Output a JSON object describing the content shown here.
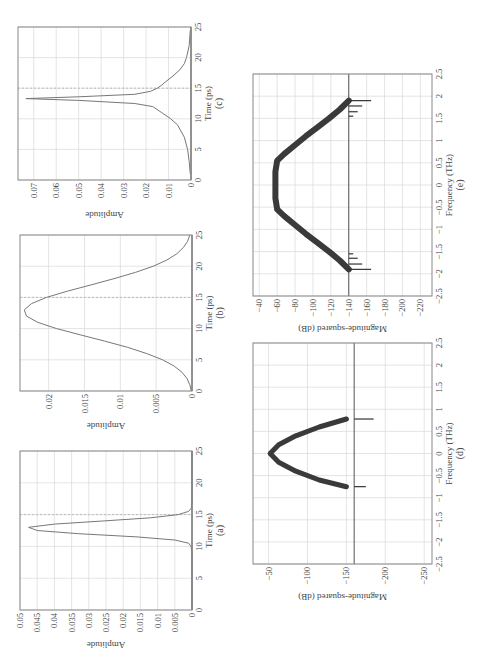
{
  "figure": {
    "panels": [
      "(a)",
      "(b)",
      "(c)",
      "(d)",
      "(e)"
    ]
  },
  "chart_data": [
    {
      "id": "a",
      "type": "line",
      "panel_label": "(a)",
      "xlabel": "Time (ps)",
      "ylabel": "Amplitude",
      "xlim": [
        0,
        25
      ],
      "ylim": [
        0,
        0.05
      ],
      "xticks": [
        0,
        5,
        10,
        15,
        20,
        25
      ],
      "yticks": [
        0,
        0.005,
        0.01,
        0.015,
        0.02,
        0.025,
        0.03,
        0.035,
        0.04,
        0.045,
        0.05
      ],
      "ytick_labels": [
        "0",
        "0.005",
        "0.01",
        "0.015",
        "0.02",
        "0.025",
        "0.03",
        "0.035",
        "0.04",
        "0.045",
        "0.05"
      ],
      "grid": true,
      "dashed_marker_x": 15,
      "series": [
        {
          "name": "pulse",
          "x": [
            0,
            9,
            10,
            10.5,
            11,
            11.5,
            12,
            12.5,
            13,
            13.5,
            14,
            14.5,
            15,
            15.5,
            16,
            17,
            25
          ],
          "values": [
            0,
            0,
            0.0003,
            0.001,
            0.005,
            0.016,
            0.033,
            0.045,
            0.0475,
            0.04,
            0.026,
            0.012,
            0.004,
            0.001,
            0.0002,
            0,
            0
          ]
        }
      ]
    },
    {
      "id": "b",
      "type": "line",
      "panel_label": "(b)",
      "xlabel": "Time (ps)",
      "ylabel": "Amplitude",
      "xlim": [
        0,
        25
      ],
      "ylim": [
        0,
        0.024
      ],
      "xticks": [
        0,
        5,
        10,
        15,
        20,
        25
      ],
      "yticks": [
        0,
        0.005,
        0.01,
        0.015,
        0.02
      ],
      "ytick_labels": [
        "0",
        "0.005",
        "0.01",
        "0.015",
        "0.02"
      ],
      "grid": true,
      "dashed_marker_x": 15,
      "series": [
        {
          "name": "pulse",
          "x": [
            0,
            1,
            2,
            3,
            4,
            5,
            6,
            7,
            8,
            9,
            10,
            11,
            12,
            13,
            14,
            15,
            16,
            17,
            18,
            19,
            20,
            21,
            22,
            23,
            24,
            25
          ],
          "values": [
            0.0001,
            0.0003,
            0.0007,
            0.0014,
            0.0025,
            0.0041,
            0.0063,
            0.009,
            0.0122,
            0.0156,
            0.0189,
            0.0215,
            0.0231,
            0.0234,
            0.0224,
            0.0203,
            0.0174,
            0.0141,
            0.0109,
            0.0079,
            0.0054,
            0.0035,
            0.0021,
            0.0012,
            0.0006,
            0.0003
          ]
        }
      ]
    },
    {
      "id": "c",
      "type": "line",
      "panel_label": "(c)",
      "xlabel": "Time (ps)",
      "ylabel": "Amplitude",
      "xlim": [
        0,
        25
      ],
      "ylim": [
        0,
        0.077
      ],
      "xticks": [
        0,
        5,
        10,
        15,
        20,
        25
      ],
      "yticks": [
        0,
        0.01,
        0.02,
        0.03,
        0.04,
        0.05,
        0.06,
        0.07
      ],
      "ytick_labels": [
        "0",
        "0.01",
        "0.02",
        "0.03",
        "0.04",
        "0.05",
        "0.06",
        "0.07"
      ],
      "grid": true,
      "dashed_marker_x": 15,
      "series": [
        {
          "name": "pulse",
          "x": [
            1,
            3,
            5,
            7,
            9,
            10,
            11,
            12,
            12.5,
            13,
            13.3,
            13.6,
            14,
            14.5,
            15,
            15.5,
            16,
            17,
            18,
            19,
            20,
            22,
            24.5
          ],
          "values": [
            0.0003,
            0.0008,
            0.0015,
            0.003,
            0.006,
            0.009,
            0.013,
            0.017,
            0.025,
            0.05,
            0.0735,
            0.05,
            0.025,
            0.018,
            0.015,
            0.013,
            0.0115,
            0.008,
            0.005,
            0.003,
            0.002,
            0.0008,
            0.0003
          ]
        }
      ]
    },
    {
      "id": "d",
      "type": "line",
      "panel_label": "(d)",
      "xlabel": "Frequency (THz)",
      "ylabel": "Magnitude-squared (dB)",
      "xlim": [
        -2.5,
        2.5
      ],
      "ylim": [
        -260,
        -30
      ],
      "xticks": [
        -2.5,
        -2,
        -1.5,
        -1,
        -0.5,
        0,
        0.5,
        1,
        1.5,
        2,
        2.5
      ],
      "yticks": [
        -250,
        -200,
        -150,
        -100,
        -50
      ],
      "ytick_labels": [
        "−250",
        "−200",
        "−150",
        "−100",
        "−50"
      ],
      "grid": true,
      "noise_floor_db": -160,
      "series": [
        {
          "name": "spectrum",
          "x": [
            -0.75,
            -0.6,
            -0.4,
            -0.2,
            0,
            0.2,
            0.4,
            0.6,
            0.78
          ],
          "values": [
            -150,
            -115,
            -85,
            -63,
            -52,
            -63,
            -85,
            -115,
            -150
          ]
        }
      ]
    },
    {
      "id": "e",
      "type": "line",
      "panel_label": "(e)",
      "xlabel": "Frequency (THz)",
      "ylabel": "Magnitude-squared (dB)",
      "xlim": [
        -2.5,
        2.5
      ],
      "ylim": [
        -233,
        -33
      ],
      "xticks": [
        -2.5,
        -2,
        -1.5,
        -1,
        -0.5,
        0,
        0.5,
        1,
        1.5,
        2,
        2.5
      ],
      "yticks": [
        -220,
        -200,
        -180,
        -160,
        -140,
        -120,
        -100,
        -80,
        -60,
        -40
      ],
      "ytick_labels": [
        "−220",
        "−200",
        "−180",
        "−160",
        "−140",
        "−120",
        "−100",
        "−80",
        "−60",
        "−40"
      ],
      "grid": true,
      "noise_floor_db": -140,
      "series": [
        {
          "name": "spectrum",
          "x": [
            -1.9,
            -1.7,
            -1.5,
            -1.3,
            -1.1,
            -0.9,
            -0.7,
            -0.55,
            -0.3,
            0,
            0.3,
            0.55,
            0.7,
            0.9,
            1.1,
            1.3,
            1.5,
            1.7,
            1.9
          ],
          "values": [
            -140,
            -130,
            -118,
            -105,
            -92,
            -80,
            -68,
            -60,
            -58,
            -58,
            -58,
            -60,
            -68,
            -80,
            -92,
            -105,
            -118,
            -130,
            -140
          ]
        }
      ]
    }
  ]
}
